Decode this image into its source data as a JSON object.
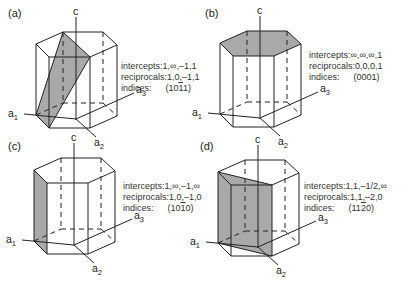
{
  "figure": {
    "panels": [
      {
        "id": "a",
        "label": "(a)",
        "shaded": "plane-10-11",
        "intercepts_label": "intercepts:",
        "intercepts": "1,∞,–1,1",
        "reciprocals_label": "reciprocals:",
        "reciprocals": "1,0,–1,1",
        "indices_label": "indices:",
        "indices": [
          "1",
          "0",
          "1",
          "1"
        ],
        "indices_overbar": [
          false,
          false,
          true,
          false
        ]
      },
      {
        "id": "b",
        "label": "(b)",
        "shaded": "basal-top",
        "intercepts_label": "intercepts:",
        "intercepts": "∞,∞,∞,1",
        "reciprocals_label": "reciprocals:",
        "reciprocals": "0,0,0,1",
        "indices_label": "indices:",
        "indices": [
          "0",
          "0",
          "0",
          "1"
        ],
        "indices_overbar": [
          false,
          false,
          false,
          false
        ]
      },
      {
        "id": "c",
        "label": "(c)",
        "shaded": "prism-left-face",
        "intercepts_label": "intercepts:",
        "intercepts": "1,∞,–1,∞",
        "reciprocals_label": "reciprocals:",
        "reciprocals": "1,0,–1,0",
        "indices_label": "indices:",
        "indices": [
          "1",
          "0",
          "1",
          "0"
        ],
        "indices_overbar": [
          false,
          false,
          true,
          false
        ]
      },
      {
        "id": "d",
        "label": "(d)",
        "shaded": "plane-11-20",
        "intercepts_label": "intercepts:",
        "intercepts": "1,1,–1/2,∞",
        "reciprocals_label": "reciprocals:",
        "reciprocals": "1,1,–2,0",
        "indices_label": "indices:",
        "indices": [
          "1",
          "1",
          "2",
          "0"
        ],
        "indices_overbar": [
          false,
          false,
          true,
          false
        ]
      }
    ],
    "axes": {
      "c": "c",
      "a1": [
        "a",
        "1"
      ],
      "a2": [
        "a",
        "2"
      ],
      "a3": [
        "a",
        "3"
      ]
    },
    "colors": {
      "shade": "#a9a9a9",
      "line": "#222222"
    }
  }
}
